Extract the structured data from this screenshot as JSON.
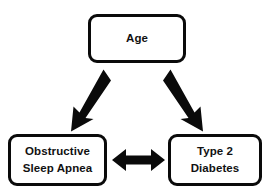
{
  "diagram": {
    "background_color": "#ffffff",
    "stroke_color": "#0a0a0a",
    "text_color": "#111111",
    "nodes": [
      {
        "id": "age",
        "label_lines": [
          "Age"
        ],
        "line1": "Age"
      },
      {
        "id": "obstructive-sleep-apnea",
        "label_lines": [
          "Obstructive",
          "Sleep Apnea"
        ],
        "line1": "Obstructive",
        "line2": "Sleep Apnea"
      },
      {
        "id": "type-2-diabetes",
        "label_lines": [
          "Type 2",
          "Diabetes"
        ],
        "line1": "Type 2",
        "line2": "Diabetes"
      }
    ],
    "edges": [
      {
        "id": "age-to-osa",
        "from": "age",
        "to": "obstructive-sleep-apnea",
        "direction": "one-way",
        "orientation": "diagonal-down-left"
      },
      {
        "id": "age-to-t2d",
        "from": "age",
        "to": "type-2-diabetes",
        "direction": "one-way",
        "orientation": "diagonal-down-right"
      },
      {
        "id": "osa-to-t2d",
        "from": "obstructive-sleep-apnea",
        "to": "type-2-diabetes",
        "direction": "bidirectional",
        "orientation": "horizontal"
      }
    ]
  }
}
